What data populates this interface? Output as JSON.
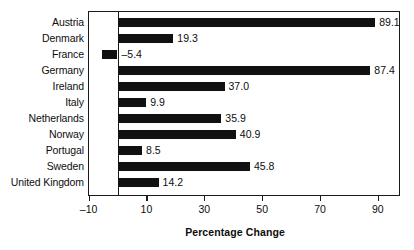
{
  "chart_data": {
    "type": "bar",
    "orientation": "horizontal",
    "title": "",
    "xlabel": "Percentage Change",
    "ylabel": "",
    "xlim": [
      -10,
      95
    ],
    "xticks": [
      -10,
      10,
      30,
      50,
      70,
      90
    ],
    "xtick_labels": [
      "–10",
      "10",
      "30",
      "50",
      "70",
      "90"
    ],
    "grid": false,
    "legend": null,
    "categories": [
      "Austria",
      "Denmark",
      "France",
      "Germany",
      "Ireland",
      "Italy",
      "Netherlands",
      "Norway",
      "Portugal",
      "Sweden",
      "United Kingdom"
    ],
    "values": [
      89.1,
      19.3,
      -5.4,
      87.4,
      37.0,
      9.9,
      35.9,
      40.9,
      8.5,
      45.8,
      14.2
    ],
    "value_labels": [
      "89.1",
      "19.3",
      "–5.4",
      "87.4",
      "37.0",
      "9.9",
      "35.9",
      "40.9",
      "8.5",
      "45.8",
      "14.2"
    ],
    "bar_color": "#111111",
    "frame_color": "#1a1a1a",
    "background": "#ffffff"
  },
  "axis": {
    "title": "Percentage Change"
  }
}
